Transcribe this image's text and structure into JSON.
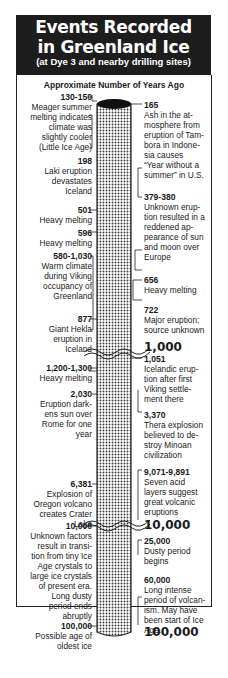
{
  "header": {
    "title_line1": "Events Recorded",
    "title_line2": "in Greenland Ice",
    "subtitle": "(at Dye 3 and nearby drilling sites)"
  },
  "axis_label": "Approximate Number of Years Ago",
  "scale_markers": [
    "1,000",
    "10,000",
    "100,000"
  ],
  "left_events": [
    {
      "years": "130-150",
      "lines": [
        "Meager summer",
        "melting indicates",
        "climate was",
        "slightly cooler",
        "(Little Ice Age)"
      ]
    },
    {
      "years": "198",
      "lines": [
        "Laki eruption",
        "devastates",
        "Iceland"
      ]
    },
    {
      "years": "501",
      "lines": [
        "Heavy melting"
      ]
    },
    {
      "years": "596",
      "lines": [
        "Heavy melting"
      ]
    },
    {
      "years": "580-1,030",
      "lines": [
        "Warm climate",
        "during Viking",
        "occupancy of",
        "Greenland"
      ]
    },
    {
      "years": "877",
      "lines": [
        "Giant Hekla",
        "eruption in",
        "Iceland"
      ]
    },
    {
      "years": "1,200-1,300",
      "lines": [
        "Heavy melting"
      ]
    },
    {
      "years": "2,030",
      "lines": [
        "Eruption dark-",
        "ens sun over",
        "Rome for one",
        "year"
      ]
    },
    {
      "years": "6,381",
      "lines": [
        "Explosion of",
        "Oregon volcano",
        "creates Crater",
        "Lake"
      ]
    },
    {
      "years": "10,000",
      "lines": [
        "Unknown factors",
        "result in transi-",
        "tion from tiny Ice",
        "Age crystals to",
        "large ice crystals",
        "of present era.",
        "Long dusty",
        "period ends",
        "abruptly"
      ]
    },
    {
      "years": "100,000",
      "lines": [
        "Possible age of",
        "oldest ice"
      ]
    }
  ],
  "right_events": [
    {
      "years": "165",
      "lines": [
        "Ash in the at-",
        "mosphere from",
        "eruption of Tam-",
        "bora in Indone-",
        "sia causes",
        "“Year without a",
        "summer” in U.S."
      ]
    },
    {
      "years": "379-380",
      "lines": [
        "Unknown erup-",
        "tion resulted in a",
        "reddened ap-",
        "pearance of sun",
        "and moon over",
        "Europe"
      ]
    },
    {
      "years": "656",
      "lines": [
        "Heavy melting"
      ]
    },
    {
      "years": "722",
      "lines": [
        "Major eruption;",
        "source unknown"
      ]
    },
    {
      "years": "1,051",
      "lines": [
        "Icelandic erup-",
        "tion after first",
        "Viking settle-",
        "ment there"
      ]
    },
    {
      "years": "3,370",
      "lines": [
        "Thera explosion",
        "believed to de-",
        "stroy Minoan",
        "civilization"
      ]
    },
    {
      "years": "9,071-9,891",
      "lines": [
        "Seven acid",
        "layers suggest",
        "great volcanic",
        "eruptions"
      ]
    },
    {
      "years": "25,000",
      "lines": [
        "Dusty period",
        "begins"
      ]
    },
    {
      "years": "60,000",
      "lines": [
        "Long intense",
        "period of volcan-",
        "ism. May have",
        "been start of Ice",
        "Age."
      ]
    }
  ]
}
